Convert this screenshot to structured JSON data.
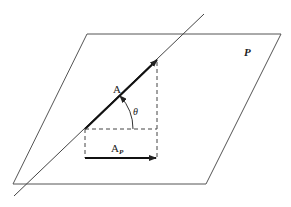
{
  "diagram": {
    "plane_label": "P",
    "vector_label": "A",
    "angle_label": "θ",
    "projection_label": "A",
    "projection_subscript": "P",
    "colors": {
      "stroke": "#333333",
      "plane": "#555555",
      "background": "#ffffff"
    }
  }
}
